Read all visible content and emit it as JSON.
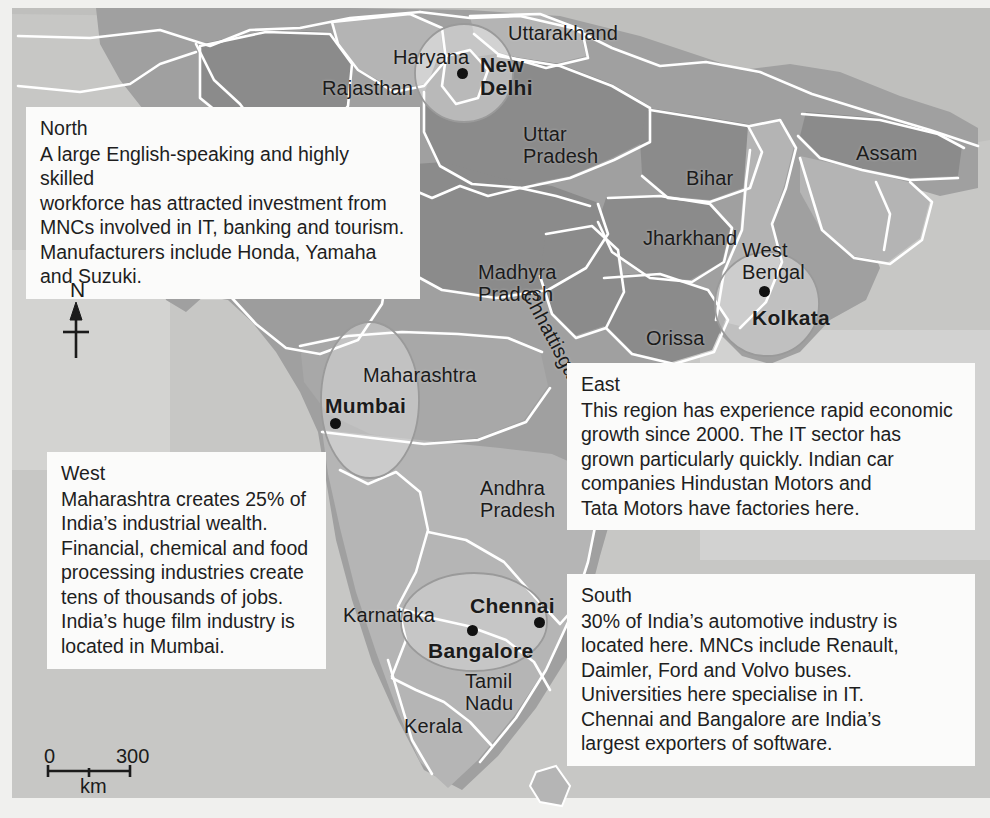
{
  "figure": {
    "kind": "thematic-map",
    "colors": {
      "background": "#f2f2f0",
      "sea": "#c9c9c7",
      "state_dark": "#8b8b8b",
      "state_mid": "#a3a3a3",
      "state_light": "#b9b9b9",
      "state_pale": "#d2d2d0",
      "border": "#ffffff",
      "highlight_circle_stroke": "#9a9a9a",
      "highlight_circle_fill": "#ffffff",
      "text": "#1b1b1b",
      "box_background": "#fbfbfa"
    }
  },
  "states": [
    {
      "name": "Rajasthan",
      "x": 322,
      "y": 78,
      "rotate": 0
    },
    {
      "name": "Haryana",
      "x": 393,
      "y": 47,
      "rotate": 0
    },
    {
      "name": "Uttarakhand",
      "x": 508,
      "y": 23,
      "rotate": 0
    },
    {
      "name": "Uttar\nPradesh",
      "x": 523,
      "y": 124,
      "rotate": 0
    },
    {
      "name": "Bihar",
      "x": 686,
      "y": 168,
      "rotate": 0
    },
    {
      "name": "Assam",
      "x": 856,
      "y": 143,
      "rotate": 0
    },
    {
      "name": "Jharkhand",
      "x": 643,
      "y": 228,
      "rotate": 0
    },
    {
      "name": "West\nBengal",
      "x": 742,
      "y": 240,
      "rotate": 0
    },
    {
      "name": "Gujarat",
      "x": 279,
      "y": 264,
      "rotate": 0
    },
    {
      "name": "Madhyra\nPradesh",
      "x": 478,
      "y": 262,
      "rotate": 0
    },
    {
      "name": "Chhattisgarh",
      "x": 537,
      "y": 286,
      "rotate": 62
    },
    {
      "name": "Orissa",
      "x": 646,
      "y": 328,
      "rotate": 0
    },
    {
      "name": "Maharashtra",
      "x": 363,
      "y": 365,
      "rotate": 0
    },
    {
      "name": "Andhra\nPradesh",
      "x": 480,
      "y": 478,
      "rotate": 0
    },
    {
      "name": "Karnataka",
      "x": 343,
      "y": 605,
      "rotate": 0
    },
    {
      "name": "Tamil\nNadu",
      "x": 465,
      "y": 671,
      "rotate": 0
    },
    {
      "name": "Kerala",
      "x": 404,
      "y": 716,
      "rotate": 0
    }
  ],
  "cities": [
    {
      "name": "New\nDelhi",
      "label_x": 480,
      "label_y": 54,
      "dot_x": 463,
      "dot_y": 74
    },
    {
      "name": "Kolkata",
      "label_x": 752,
      "label_y": 307,
      "dot_x": 765,
      "dot_y": 292
    },
    {
      "name": "Mumbai",
      "label_x": 325,
      "label_y": 395,
      "dot_x": 336,
      "dot_y": 424
    },
    {
      "name": "Chennai",
      "label_x": 470,
      "label_y": 595,
      "dot_x": 540,
      "dot_y": 623
    },
    {
      "name": "Bangalore",
      "label_x": 428,
      "label_y": 640,
      "dot_x": 473,
      "dot_y": 631
    }
  ],
  "highlights": [
    {
      "region": "north-delhi",
      "cx": 464,
      "cy": 73,
      "rx": 49,
      "ry": 49
    },
    {
      "region": "east-kolkata",
      "cx": 767,
      "cy": 304,
      "rx": 52,
      "ry": 52
    },
    {
      "region": "west-mumbai",
      "cx": 370,
      "cy": 400,
      "rx": 49,
      "ry": 78
    },
    {
      "region": "south-chennai-bangalore",
      "cx": 474,
      "cy": 622,
      "rx": 73,
      "ry": 49
    }
  ],
  "info_boxes": [
    {
      "id": "north",
      "title": "North",
      "body": "A large English-speaking and highly skilled\nworkforce has attracted investment from\nMNCs involved in IT, banking and tourism.\nManufacturers include Honda, Yamaha\nand Suzuki.",
      "x": 26,
      "y": 107,
      "w": 394,
      "h": 162
    },
    {
      "id": "east",
      "title": "East",
      "body": "This region has experience rapid economic\ngrowth since 2000. The IT sector has\ngrown particularly quickly. Indian car\ncompanies Hindustan Motors and\nTata Motors have factories here.",
      "x": 567,
      "y": 363,
      "w": 408,
      "h": 163
    },
    {
      "id": "west",
      "title": "West",
      "body": "Maharashtra creates 25% of\nIndia’s industrial wealth.\nFinancial, chemical and food\nprocessing industries create\ntens of thousands of jobs.\nIndia’s huge film industry is\nlocated in Mumbai.",
      "x": 47,
      "y": 452,
      "w": 279,
      "h": 210
    },
    {
      "id": "south",
      "title": "South",
      "body": "30% of India’s automotive industry is\nlocated here. MNCs include Renault,\nDaimler, Ford and Volvo buses.\nUniversities here specialise in IT.\nChennai and Bangalore are India’s\nlargest exporters of software.",
      "x": 567,
      "y": 574,
      "w": 408,
      "h": 188
    }
  ],
  "compass": {
    "label": "N"
  },
  "scale_bar": {
    "min": "0",
    "max": "300",
    "unit": "km"
  }
}
